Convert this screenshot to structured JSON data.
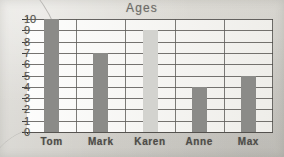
{
  "chart_data": {
    "type": "bar",
    "title": "Ages",
    "xlabel": "",
    "ylabel": "",
    "categories": [
      "Tom",
      "Mark",
      "Karen",
      "Anne",
      "Max"
    ],
    "values": [
      10,
      7,
      9,
      4,
      5
    ],
    "ylim": [
      0,
      10
    ],
    "yticks": [
      0,
      1,
      2,
      3,
      4,
      5,
      6,
      7,
      8,
      9,
      10
    ],
    "ytick_labels": [
      "0",
      "1",
      "2",
      "3",
      "4",
      "5",
      "6",
      "7",
      "8",
      "9",
      "10"
    ],
    "grid": true,
    "grid_axis": "both",
    "legend": false,
    "bar_colors": [
      "#8b8b88",
      "#8b8b88",
      "#d3d3cf",
      "#8b8b88",
      "#8b8b88"
    ],
    "series": [
      {
        "name": "Ages",
        "values": [
          10,
          7,
          9,
          4,
          5
        ]
      }
    ]
  },
  "chart": {
    "title": "Ages",
    "axis_color": "#3f3d3a",
    "grid_color": "#5d5b57",
    "plot_bg": "#fbfbf9",
    "page_bg": "#d8d8d4",
    "bar_dark": "#8b8b88",
    "bar_light": "#d3d3cf",
    "bars": [
      {
        "label": "Tom",
        "value": 10,
        "color": "#8b8b88"
      },
      {
        "label": "Mark",
        "value": 7,
        "color": "#8b8b88"
      },
      {
        "label": "Karen",
        "value": 9,
        "color": "#d3d3cf"
      },
      {
        "label": "Anne",
        "value": 4,
        "color": "#8b8b88"
      },
      {
        "label": "Max",
        "value": 5,
        "color": "#8b8b88"
      }
    ],
    "y_labels": [
      "10",
      "9",
      "8",
      "7",
      "6",
      "5",
      "4",
      "3",
      "2",
      "1",
      "0"
    ]
  }
}
